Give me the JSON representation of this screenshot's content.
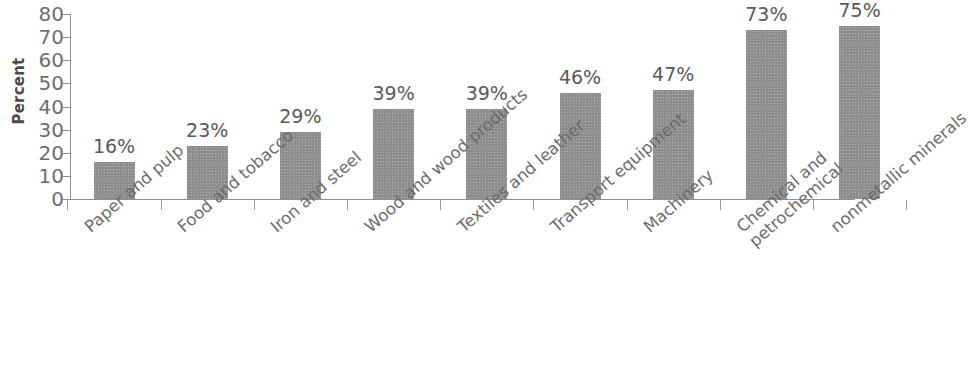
{
  "chart_data": {
    "type": "bar",
    "title": "",
    "subtitle": "",
    "xlabel": "",
    "ylabel": "Percent",
    "ylim": [
      0,
      80
    ],
    "ytick_step": 10,
    "yticks": [
      80,
      70,
      60,
      50,
      40,
      30,
      20,
      10,
      0
    ],
    "grid": false,
    "legend": false,
    "value_label_suffix": "%",
    "categories": [
      "Paper and pulp",
      "Food and tobacco",
      "Iron and steel",
      "Wood and wood products",
      "Textiles and leather",
      "Transport equipment",
      "Machinery",
      "Chemical and petrochemical",
      "nonmetallic minerals"
    ],
    "category_lines": [
      [
        "Paper and pulp"
      ],
      [
        "Food and tobacco"
      ],
      [
        "Iron and steel"
      ],
      [
        "Wood and wood products"
      ],
      [
        "Textiles and leather"
      ],
      [
        "Transport equipment"
      ],
      [
        "Machinery"
      ],
      [
        "Chemical and",
        "petrochemical"
      ],
      [
        "nonmetallic minerals"
      ]
    ],
    "values": [
      16,
      23,
      29,
      39,
      39,
      46,
      47,
      73,
      75
    ],
    "value_labels": [
      "16%",
      "23%",
      "29%",
      "39%",
      "39%",
      "46%",
      "47%",
      "73%",
      "75%"
    ],
    "bar_color": "#8d8d8d",
    "axis_color": "#8f8f8f",
    "tick_label_color": "#6e6e6e",
    "value_label_color": "#595959",
    "category_label_color": "#6b6b6b",
    "background_color": "#ffffff"
  }
}
